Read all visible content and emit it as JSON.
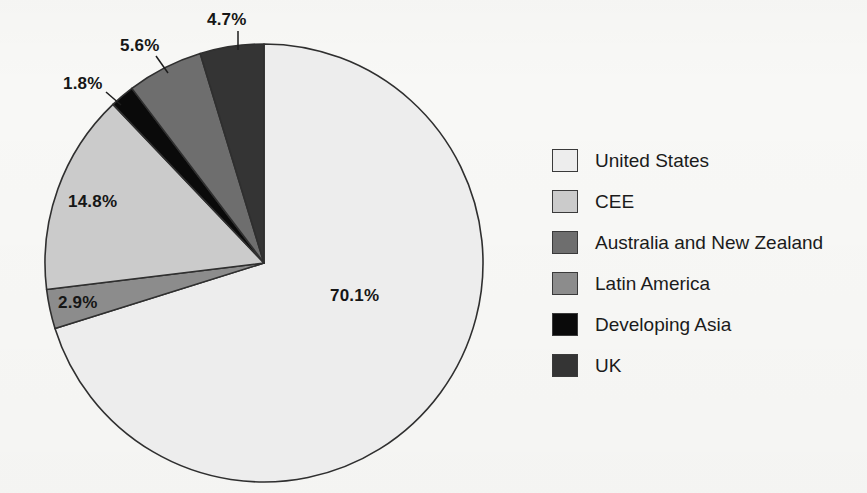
{
  "chart_data": {
    "type": "pie",
    "title": "",
    "subtitle": "",
    "xlabel": "",
    "ylabel": "",
    "legend_position": "right",
    "grid": false,
    "start_angle_deg": 0,
    "direction": "clockwise",
    "units": "percent",
    "categories": [
      "United States",
      "CEE",
      "Australia and New Zealand",
      "Latin America",
      "Developing Asia",
      "UK"
    ],
    "values": [
      70.1,
      14.8,
      5.6,
      2.9,
      1.8,
      4.7
    ],
    "labels": [
      "70.1%",
      "14.8%",
      "5.6%",
      "2.9%",
      "1.8%",
      "4.7%"
    ],
    "colors": [
      "#ededed",
      "#cbcbcb",
      "#6e6e6e",
      "#8c8c8c",
      "#0a0a0a",
      "#343434"
    ],
    "slice_order_clockwise_from_top": [
      "United States",
      "Latin America",
      "CEE",
      "Developing Asia",
      "Australia and New Zealand",
      "UK"
    ],
    "slices": [
      {
        "name": "United States",
        "value": 70.1,
        "label": "70.1%",
        "color": "#ededed"
      },
      {
        "name": "Latin America",
        "value": 2.9,
        "label": "2.9%",
        "color": "#8c8c8c"
      },
      {
        "name": "CEE",
        "value": 14.8,
        "label": "14.8%",
        "color": "#cbcbcb"
      },
      {
        "name": "Developing Asia",
        "value": 1.8,
        "label": "1.8%",
        "color": "#0a0a0a"
      },
      {
        "name": "Australia and New Zealand",
        "value": 5.6,
        "label": "5.6%",
        "color": "#6e6e6e"
      },
      {
        "name": "UK",
        "value": 4.7,
        "label": "4.7%",
        "color": "#343434"
      }
    ]
  },
  "pie": {
    "center_x": 264,
    "center_y": 263,
    "radius": 219,
    "stroke_color": "#2f2f2f",
    "value_labels": [
      {
        "name": "united-states",
        "text": "70.1%",
        "x": 330,
        "y": 286
      },
      {
        "name": "cee",
        "text": "14.8%",
        "x": 68,
        "y": 192
      },
      {
        "name": "latin-america",
        "text": "2.9%",
        "x": 58,
        "y": 293
      },
      {
        "name": "developing-asia",
        "text": "1.8%",
        "x": 63,
        "y": 74
      },
      {
        "name": "australia-new-zealand",
        "text": "5.6%",
        "x": 120,
        "y": 36
      },
      {
        "name": "uk",
        "text": "4.7%",
        "x": 207,
        "y": 10
      }
    ],
    "leader_lines": [
      {
        "name": "leader-developing-asia",
        "x1": 106,
        "y1": 92,
        "x2": 121,
        "y2": 105
      },
      {
        "name": "leader-australia",
        "x1": 156,
        "y1": 56,
        "x2": 168,
        "y2": 73
      },
      {
        "name": "leader-uk",
        "x1": 238,
        "y1": 31,
        "x2": 238,
        "y2": 50
      }
    ]
  },
  "legend": {
    "items": [
      {
        "label": "United States",
        "color": "#ededed"
      },
      {
        "label": "CEE",
        "color": "#cbcbcb"
      },
      {
        "label": "Australia and New Zealand",
        "color": "#6e6e6e"
      },
      {
        "label": "Latin America",
        "color": "#8c8c8c"
      },
      {
        "label": "Developing Asia",
        "color": "#0a0a0a"
      },
      {
        "label": "UK",
        "color": "#343434"
      }
    ]
  }
}
